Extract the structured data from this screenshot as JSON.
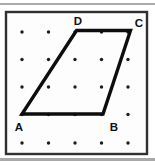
{
  "figure": {
    "frame": {
      "x": 6,
      "y": 12,
      "width": 141,
      "height": 142,
      "border_color": "#2f2f2f",
      "fill_color": "#fdfdfd"
    },
    "top_rule": {
      "y": 4,
      "color": "#8f8f8f"
    },
    "bottom_shadow": {
      "y": 158,
      "height": 3,
      "color": "#a8a8a8"
    },
    "grid": {
      "cols_x": [
        22,
        48.5,
        75,
        101.5,
        128
      ],
      "rows_y": [
        32,
        59.5,
        87,
        114.5,
        143
      ],
      "dot_radius": 1.7,
      "dot_color": "#1c1c1c"
    },
    "shape": {
      "type": "quadrilateral",
      "outline_points": "22,114 103,114 130.5,30.5 76.5,30.5",
      "stroke_color": "#0d0d0d",
      "stroke_width": 3.4
    },
    "labels": [
      {
        "text": "A",
        "x": 19,
        "y": 131
      },
      {
        "text": "B",
        "x": 114,
        "y": 131
      },
      {
        "text": "C",
        "x": 139,
        "y": 27
      },
      {
        "text": "D",
        "x": 78,
        "y": 25
      }
    ]
  }
}
